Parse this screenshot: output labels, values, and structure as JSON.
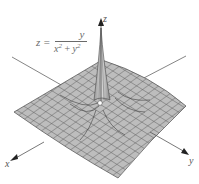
{
  "figure": {
    "equation": {
      "lhs": "z =",
      "numerator": "y",
      "denominator_base_x": "x",
      "denominator_exp": "2",
      "denominator_plus": " + ",
      "denominator_base_y": "y",
      "denominator_exp_y": "2"
    },
    "axes": {
      "x_label": "x",
      "y_label": "y",
      "z_label": "z"
    },
    "colors": {
      "surface_fill": "#b8b8b8",
      "grid_line": "#5a5a5a",
      "axis_line": "#666666",
      "origin_dot": "#ffffff"
    }
  }
}
